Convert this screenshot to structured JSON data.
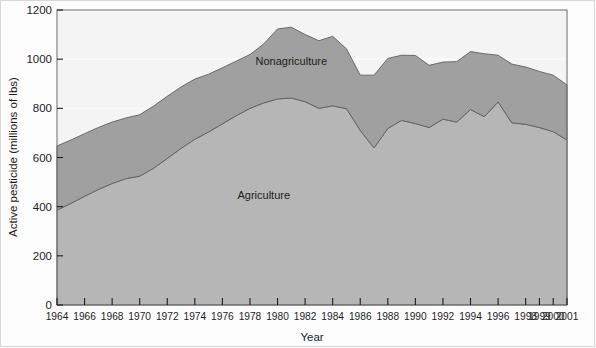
{
  "chart_data": {
    "type": "area",
    "stacked": true,
    "title": "",
    "subtitle": "",
    "xlabel": "Year",
    "ylabel": "Active pesticide (millions of lbs)",
    "xlim": [
      1964,
      2001
    ],
    "ylim": [
      0,
      1200
    ],
    "ytick_labels": [
      "0",
      "200",
      "400",
      "600",
      "800",
      "1000",
      "1200"
    ],
    "ytick_values": [
      0,
      200,
      400,
      600,
      800,
      1000,
      1200
    ],
    "xtick_labels": [
      "1964",
      "1966",
      "1968",
      "1970",
      "1972",
      "1974",
      "1976",
      "1978",
      "1980",
      "1982",
      "1984",
      "1986",
      "1988",
      "1990",
      "1992",
      "1994",
      "1996",
      "1998",
      "1999",
      "2000",
      "2001"
    ],
    "xtick_values": [
      1964,
      1966,
      1968,
      1970,
      1972,
      1974,
      1976,
      1978,
      1980,
      1982,
      1984,
      1986,
      1988,
      1990,
      1992,
      1994,
      1996,
      1998,
      1999,
      2000,
      2001
    ],
    "grid": "horizontal-faint",
    "legend_position": "inline-annotations",
    "x": [
      1964,
      1965,
      1966,
      1967,
      1968,
      1969,
      1970,
      1971,
      1972,
      1973,
      1974,
      1975,
      1976,
      1977,
      1978,
      1979,
      1980,
      1981,
      1982,
      1983,
      1984,
      1985,
      1986,
      1987,
      1988,
      1989,
      1990,
      1991,
      1992,
      1993,
      1994,
      1995,
      1996,
      1997,
      1998,
      1999,
      2000,
      2001
    ],
    "series": [
      {
        "name": "Agriculture",
        "color": "#b6b6b6",
        "label_x": 1979,
        "label_y": 430,
        "values": [
          386,
          413,
          442,
          470,
          494,
          514,
          524,
          556,
          596,
          637,
          674,
          704,
          737,
          770,
          800,
          822,
          838,
          842,
          827,
          800,
          810,
          799,
          710,
          639,
          718,
          751,
          738,
          722,
          756,
          744,
          795,
          766,
          826,
          741,
          735,
          722,
          705,
          671
        ]
      },
      {
        "name": "Nonagriculture",
        "color": "#a0a0a0",
        "label_x": 1981,
        "label_y": 975,
        "values": [
          261,
          258,
          255,
          252,
          250,
          247,
          250,
          253,
          253,
          250,
          245,
          235,
          228,
          222,
          219,
          240,
          285,
          288,
          273,
          275,
          283,
          243,
          225,
          296,
          285,
          265,
          277,
          253,
          232,
          246,
          236,
          256,
          190,
          239,
          233,
          228,
          230,
          224
        ]
      }
    ],
    "totals": [
      647,
      671,
      697,
      722,
      744,
      761,
      774,
      809,
      849,
      887,
      919,
      939,
      965,
      992,
      1019,
      1062,
      1123,
      1130,
      1100,
      1075,
      1093,
      1042,
      935,
      935,
      1003,
      1016,
      1015,
      975,
      988,
      990,
      1031,
      1022,
      1016,
      980,
      968,
      950,
      935,
      895
    ]
  },
  "annotations": {
    "nonagriculture_label": "Nonagriculture",
    "agriculture_label": "Agriculture"
  }
}
